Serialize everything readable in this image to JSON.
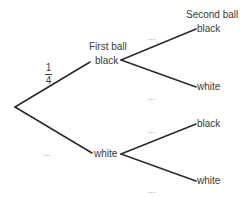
{
  "diagram": {
    "type": "probability-tree",
    "headers": {
      "first": "First ball",
      "second": "Second ball"
    },
    "root_branch_probabilities": {
      "black": {
        "numerator": "1",
        "denominator": "4"
      },
      "white": "..."
    },
    "first_level": [
      {
        "outcome": "black"
      },
      {
        "outcome": "white"
      }
    ],
    "second_level": {
      "after_black": [
        {
          "outcome": "black",
          "probability": "..."
        },
        {
          "outcome": "white",
          "probability": "..."
        }
      ],
      "after_white": [
        {
          "outcome": "black",
          "probability": "..."
        },
        {
          "outcome": "white",
          "probability": "..."
        }
      ]
    },
    "line_color": "#2b2b2b"
  }
}
